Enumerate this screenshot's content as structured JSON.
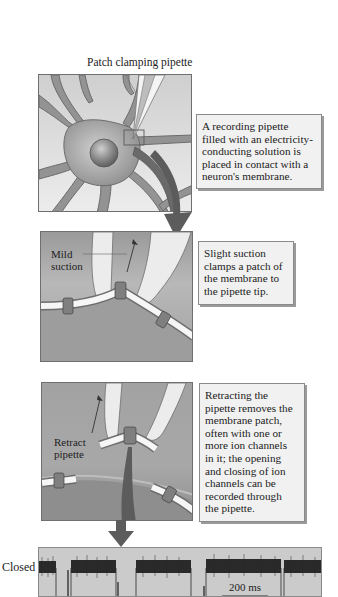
{
  "figure": {
    "title_label": "Patch clamping pipette",
    "steps": [
      {
        "id": "step-1",
        "caption": "A recording pipette\nfilled with an electricity-\nconducting solution is\nplaced in contact with a\nneuron's membrane."
      },
      {
        "id": "step-2",
        "label": "Mild\nsuction",
        "caption": "Slight suction\nclamps a patch of\nthe membrane to\nthe pipette tip."
      },
      {
        "id": "step-3",
        "label": "Retract\npipette",
        "caption": "Retracting the\npipette removes the\nmembrane patch,\noften with one or\nmore ion channels\nin it; the opening\nand closing of ion\nchannels can be\nrecorded through\nthe pipette."
      }
    ],
    "trace": {
      "state_label": "Closed",
      "scale_bar_label": "200 ms",
      "closed_segments_px": [
        [
          38,
          55
        ],
        [
          70,
          115
        ],
        [
          135,
          190
        ],
        [
          205,
          280
        ],
        [
          283,
          322
        ]
      ],
      "opening_events_px": [
        67,
        117,
        203,
        244
      ]
    },
    "colors": {
      "panel_bg_light": "#d9d9d9",
      "panel_bg_dark": "#8c8c8c",
      "neuron": "#8a8a8a",
      "arrow": "#555555",
      "caption_bg": "#f1f1f1",
      "trace_bg": "#c9c9c9",
      "trace_noise": "#2a2a2a"
    }
  }
}
